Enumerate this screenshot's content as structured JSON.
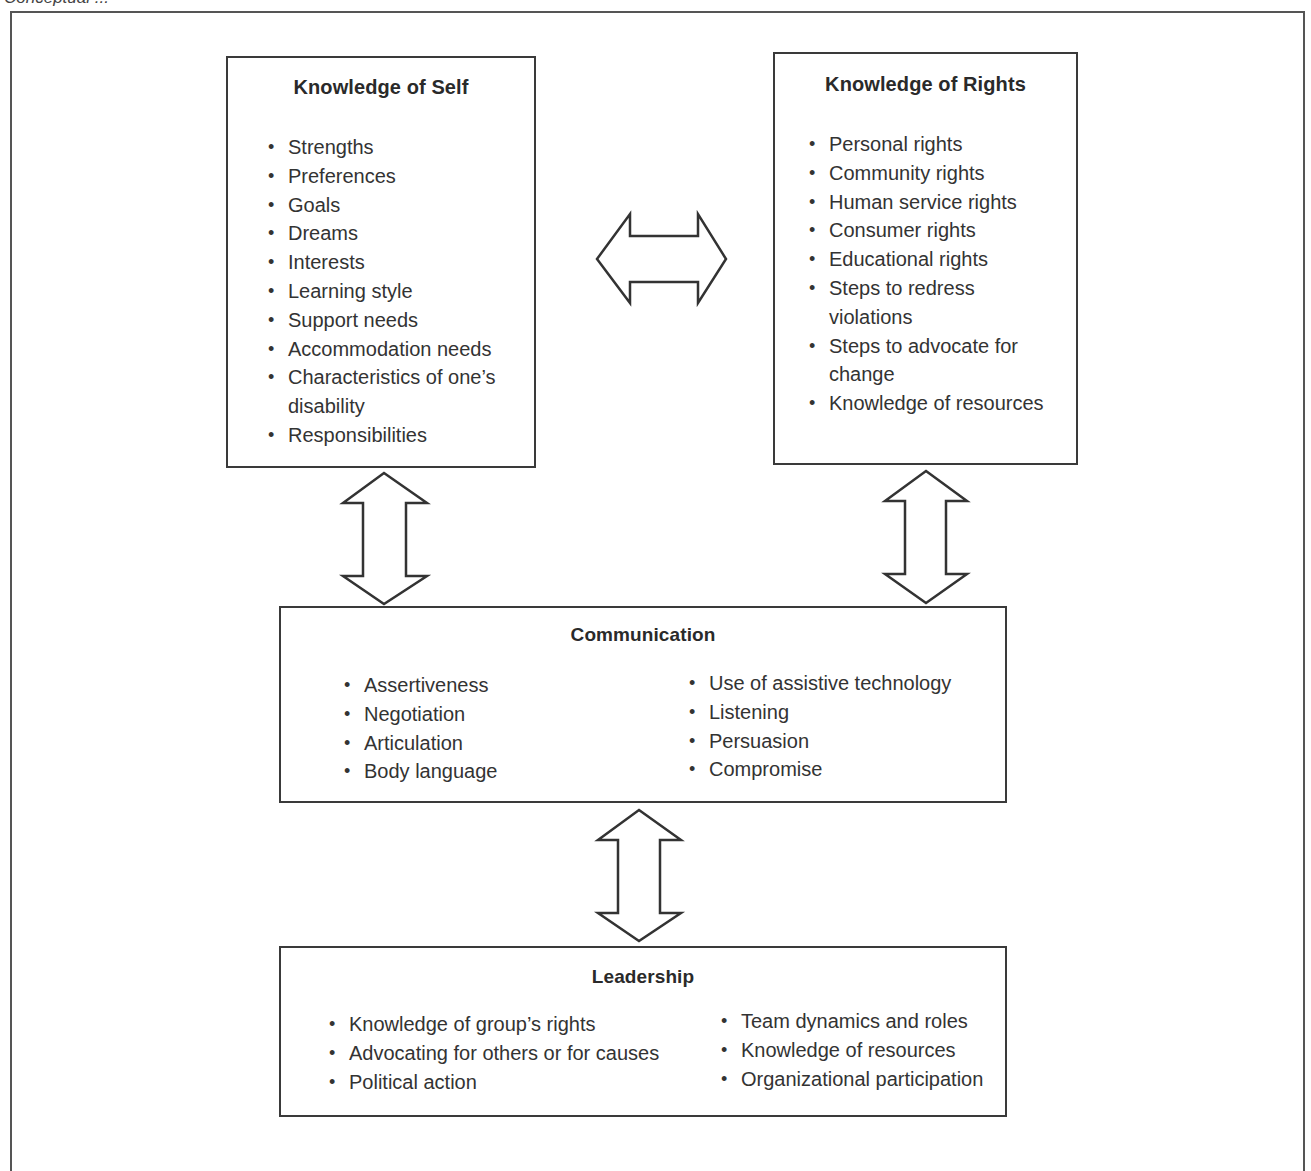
{
  "caption": {
    "text": "Conceptual ..."
  },
  "diagram": {
    "boxes": {
      "knowledge_of_self": {
        "title": "Knowledge of Self",
        "items": [
          "Strengths",
          "Preferences",
          "Goals",
          "Dreams",
          "Interests",
          "Learning style",
          "Support needs",
          "Accommodation needs",
          "Characteristics of one’s disability",
          "Responsibilities"
        ]
      },
      "knowledge_of_rights": {
        "title": "Knowledge of Rights",
        "items": [
          "Personal rights",
          "Community rights",
          "Human service rights",
          "Consumer rights",
          "Educational rights",
          "Steps to redress violations",
          "Steps to advocate for change",
          "Knowledge of resources"
        ]
      },
      "communication": {
        "title": "Communication",
        "left_items": [
          "Assertiveness",
          "Negotiation",
          "Articulation",
          "Body language"
        ],
        "right_items": [
          "Use of assistive technology",
          "Listening",
          "Persuasion",
          "Compromise"
        ]
      },
      "leadership": {
        "title": "Leadership",
        "left_items": [
          "Knowledge of group’s rights",
          "Advocating for others or for causes",
          "Political action"
        ],
        "right_items": [
          "Team dynamics and roles",
          "Knowledge of resources",
          "Organizational participation"
        ]
      }
    },
    "connections": [
      {
        "from": "Knowledge of Self",
        "to": "Knowledge of Rights",
        "type": "bidirectional",
        "orientation": "horizontal",
        "icon": "double-arrow-horizontal"
      },
      {
        "from": "Knowledge of Self",
        "to": "Communication",
        "type": "bidirectional",
        "orientation": "vertical",
        "icon": "double-arrow-vertical"
      },
      {
        "from": "Knowledge of Rights",
        "to": "Communication",
        "type": "bidirectional",
        "orientation": "vertical",
        "icon": "double-arrow-vertical"
      },
      {
        "from": "Communication",
        "to": "Leadership",
        "type": "bidirectional",
        "orientation": "vertical",
        "icon": "double-arrow-vertical"
      }
    ],
    "colors": {
      "border": "#3a3a3a",
      "text": "#333333",
      "background": "#ffffff"
    }
  }
}
